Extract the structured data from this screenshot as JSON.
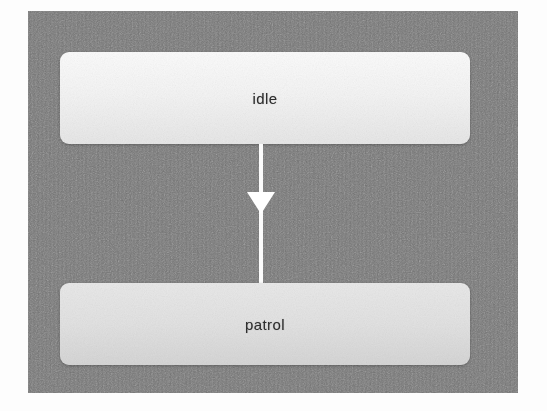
{
  "diagram": {
    "type": "state-machine",
    "title": "",
    "background_color": "#767676",
    "canvas": {
      "x": 28,
      "y": 11,
      "width": 490,
      "height": 382
    },
    "nodes": [
      {
        "id": "idle",
        "label": "idle",
        "shape": "rounded-rectangle",
        "fill_color": "#f4f4f4",
        "text_color": "#2e2e2e",
        "x": 60,
        "y": 52,
        "width": 410,
        "height": 92
      },
      {
        "id": "patrol",
        "label": "patrol",
        "shape": "rounded-rectangle",
        "fill_color": "#e2e2e2",
        "text_color": "#2e2e2e",
        "x": 60,
        "y": 283,
        "width": 410,
        "height": 82
      }
    ],
    "edges": [
      {
        "id": "idle-to-patrol",
        "from": "idle",
        "to": "patrol",
        "label": "",
        "color": "#ffffff",
        "arrowhead": "filled-triangle",
        "arrowhead_position": "midpoint",
        "direction": "down"
      }
    ]
  }
}
